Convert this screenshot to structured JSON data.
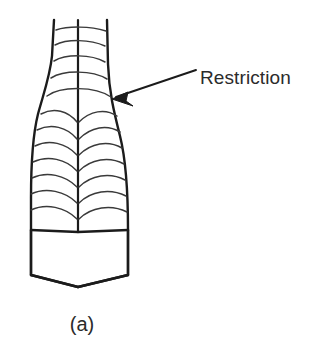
{
  "figure": {
    "caption": "(a)",
    "background_color": "#ffffff",
    "ink_color": "#1b1b1b",
    "striation_color": "#3a3a3a",
    "text_color": "#2b2b2b",
    "annotations": [
      {
        "label": "Restriction",
        "name": "restriction-label",
        "text_x": 200,
        "text_y": 84,
        "leader_start_x": 196,
        "leader_start_y": 70,
        "leader_end_x": 116,
        "leader_end_y": 97,
        "arrow_points": "112,99 128,92 126,101 133,106"
      }
    ],
    "outline": {
      "name": "crystal-outline",
      "path": "M 54 20 L 52 56 C 50 76 44 92 38 114 C 33 134 31 168 31 198 L 31 230 L 31 275 L 78 287 L 128 275 L 128 230 C 128 196 126 160 120 136 C 114 112 109 92 108 64 L 107 20"
    },
    "facet_edges": [
      {
        "name": "chevron-left-face",
        "path": "M 31 230 L 78 232"
      },
      {
        "name": "chevron-right-face",
        "path": "M 78 232 L 128 230"
      },
      {
        "name": "tip-left-side",
        "path": "M 31 230 L 31 275"
      },
      {
        "name": "tip-right-side",
        "path": "M 128 230 L 128 275"
      },
      {
        "name": "tip-bottom-left",
        "path": "M 31 275 L 78 287"
      },
      {
        "name": "tip-bottom-right",
        "path": "M 78 287 L 128 275"
      }
    ],
    "center_ridge": {
      "name": "center-ridge-line",
      "path": "M 78 20 L 78 232"
    },
    "striations": [
      {
        "name": "growth-line-neck-1",
        "path": "M 56 30 C 68 26 90 26 106 31"
      },
      {
        "name": "growth-line-neck-2",
        "path": "M 55 45 C 67 39 90 39 105 46"
      },
      {
        "name": "growth-line-neck-3",
        "path": "M 54 61 C 66 54 91 54 105 62"
      },
      {
        "name": "growth-line-neck-4",
        "path": "M 51 78 C 64 70 92 70 107 79"
      },
      {
        "name": "growth-line-restriction",
        "path": "M 47 96 C 61 86 95 86 111 97"
      },
      {
        "name": "growth-line-body-1-left",
        "path": "M 41 114 C 54 107 68 111 77 122"
      },
      {
        "name": "growth-line-body-1-right",
        "path": "M 79 122 C 90 111 105 108 117 116"
      },
      {
        "name": "growth-line-body-2-left",
        "path": "M 37 130 C 51 123 67 127 77 139"
      },
      {
        "name": "growth-line-body-2-right",
        "path": "M 79 139 C 91 127 107 124 120 132"
      },
      {
        "name": "growth-line-body-3-left",
        "path": "M 35 146 C 49 139 66 143 77 155"
      },
      {
        "name": "growth-line-body-3-right",
        "path": "M 79 155 C 91 143 108 140 122 148"
      },
      {
        "name": "growth-line-body-4-left",
        "path": "M 33 162 C 48 155 66 159 77 171"
      },
      {
        "name": "growth-line-body-4-right",
        "path": "M 79 171 C 91 159 109 156 124 164"
      },
      {
        "name": "growth-line-body-5-left",
        "path": "M 32 178 C 47 171 65 175 77 187"
      },
      {
        "name": "growth-line-body-5-right",
        "path": "M 79 187 C 91 175 110 172 125 180"
      },
      {
        "name": "growth-line-body-6-left",
        "path": "M 31 194 C 46 187 65 191 77 203"
      },
      {
        "name": "growth-line-body-6-right",
        "path": "M 79 203 C 91 191 110 188 126 196"
      },
      {
        "name": "growth-line-body-7-left",
        "path": "M 31 210 C 46 203 65 207 77 219"
      },
      {
        "name": "growth-line-body-7-right",
        "path": "M 79 219 C 91 207 111 204 127 212"
      }
    ],
    "caption_position": {
      "x": 82,
      "y": 331
    }
  }
}
